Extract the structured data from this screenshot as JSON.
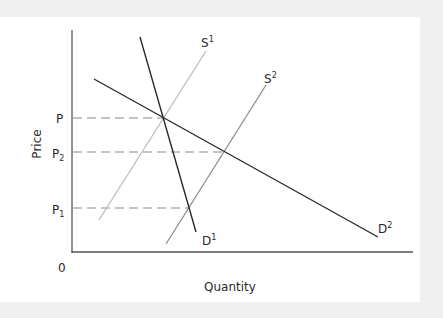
{
  "diagram": {
    "type": "supply-demand",
    "axes": {
      "x_label": "Quantity",
      "y_label": "Price",
      "origin_label": "0"
    },
    "price_levels": [
      {
        "id": "P",
        "base": "P",
        "sub": ""
      },
      {
        "id": "P2",
        "base": "P",
        "sub": "2"
      },
      {
        "id": "P1",
        "base": "P",
        "sub": "1"
      }
    ],
    "curves": [
      {
        "id": "S1",
        "base": "S",
        "sup": "1",
        "kind": "supply",
        "color": "#bdbdbd"
      },
      {
        "id": "S2",
        "base": "S",
        "sup": "2",
        "kind": "supply",
        "color": "#8c8c8c"
      },
      {
        "id": "D1",
        "base": "D",
        "sup": "1",
        "kind": "demand",
        "color": "#2b2b2b"
      },
      {
        "id": "D2",
        "base": "D",
        "sup": "2",
        "kind": "demand",
        "color": "#2b2b2b"
      }
    ],
    "equilibria": [
      {
        "curves": [
          "S1",
          "D1"
        ],
        "price": "P"
      },
      {
        "curves": [
          "S2",
          "D2"
        ],
        "price": "P2"
      },
      {
        "curves": [
          "S2",
          "D1"
        ],
        "price": "P1"
      }
    ],
    "colors": {
      "background": "#f0f0f0",
      "panel": "#ffffff",
      "axis": "#555555",
      "dashed": "#8a8a8a",
      "text": "#2a2a2a"
    }
  }
}
